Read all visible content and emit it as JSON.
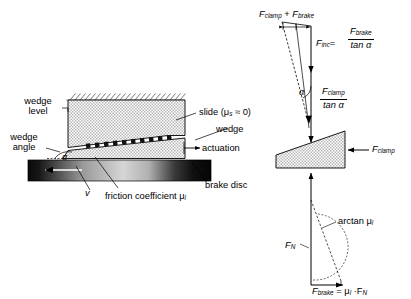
{
  "figure": {
    "type": "engineering-diagram",
    "background_color": "#ffffff",
    "line_color": "#000000",
    "hatch_fill_color": "#d8d8d8"
  },
  "left_diagram": {
    "labels": {
      "wedge_level_line1": "wedge",
      "wedge_level_line2": "level",
      "wedge_angle_line1": "wedge",
      "wedge_angle_line2": "angle",
      "alpha": "α",
      "velocity": "v",
      "friction_coefficient": "friction coefficient μ",
      "friction_coefficient_sub": "l",
      "brake_disc": "brake disc",
      "slide": "slide (μ",
      "slide_sub": "s",
      "slide_tail": " ≈ 0)",
      "wedge": "wedge",
      "actuation": "actuation"
    },
    "elements": {
      "fixed_support_hatch": "ground-hatch-strokes",
      "upper_block": "stationary-caliper-block",
      "wedge_body": "wedge",
      "roller_row": "roller-bearing-squares",
      "brake_disc_bar": "gradient-bar"
    }
  },
  "right_diagram": {
    "labels": {
      "sum_force": {
        "clamp": "F",
        "clamp_sub": "clamp",
        "plus": " + ",
        "brake": "F",
        "brake_sub": "brake"
      },
      "f_inc": {
        "name": "F",
        "sub": "inc",
        "eq": "="
      },
      "f_inc_fraction": {
        "numerator": "F",
        "numerator_sub": "brake",
        "denominator": "tan α"
      },
      "f_clamp_fraction": {
        "numerator": "F",
        "numerator_sub": "clamp",
        "denominator": "tan α"
      },
      "alpha": "α",
      "f_clamp": {
        "name": "F",
        "sub": "clamp"
      },
      "f_normal": {
        "name": "F",
        "sub": "N"
      },
      "arctan": "arctan μ",
      "arctan_sub": "l",
      "f_brake_eq": {
        "name": "F",
        "sub": "brake",
        "rest": " = μ",
        "rest_sub": "l",
        "tail": " ·F",
        "tail_sub": "N"
      }
    },
    "elements": {
      "wedge_body": "wedge",
      "force_triangle_top": "upper-force-triangle",
      "force_triangle_bottom": "lower-force-triangle"
    }
  }
}
